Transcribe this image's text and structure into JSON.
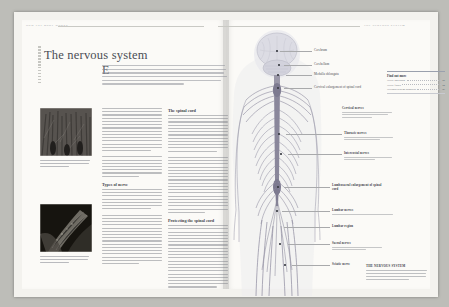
{
  "document": {
    "kind": "book-spread-scan",
    "title": "The nervous system",
    "left_running_head": "HOW THE BODY WORKS",
    "right_running_head": "THE NERVOUS SYSTEM",
    "intro": "Every single second, whether you are awake or asleep, nerves carry information in the form of electrical impulses from every part of the body to the brain and back. Via this intricate network of nerves – the body's communication network – the brain monitors and controls all your bodily functions."
  },
  "body": {
    "column_a": {
      "para1_lines": 14,
      "subhead2": "Types of nerve",
      "para2_lines": 16
    },
    "column_b": {
      "subhead1": "The spinal cord",
      "para1_lines": 21,
      "subhead2": "Protecting the spinal cord",
      "para2_lines": 15
    }
  },
  "photos": [
    {
      "name": "nerve-cells-micrograph",
      "caption_lines": 3
    },
    {
      "name": "nerve-fibre-micrograph",
      "caption_lines": 3
    }
  ],
  "figure": {
    "labels": [
      {
        "text": "Cerebrum",
        "x": 82,
        "y": 20,
        "leader_from": 50,
        "dot_x": 44,
        "dot_y": 21
      },
      {
        "text": "Cerebellum",
        "x": 82,
        "y": 32,
        "leader_from": 50,
        "dot_x": 46,
        "dot_y": 35
      },
      {
        "text": "Medulla oblongata",
        "x": 82,
        "y": 43,
        "leader_from": 56,
        "dot_x": 47,
        "dot_y": 45
      },
      {
        "text": "Cervical enlargement of spinal cord",
        "x": 82,
        "y": 58,
        "leader_from": 52,
        "dot_x": 47,
        "dot_y": 58
      },
      {
        "text": "Cervical nerves",
        "x": 112,
        "y": 80,
        "leader_from": 0,
        "sub_lines": 3
      },
      {
        "text": "Thoracic nerves",
        "x": 112,
        "y": 104,
        "leader_from": 62,
        "dot_x": 49,
        "dot_y": 104,
        "sub_lines": 2
      },
      {
        "text": "Intercostal nerves",
        "x": 112,
        "y": 126,
        "leader_from": 62,
        "dot_x": 52,
        "dot_y": 122,
        "sub_lines": 2
      },
      {
        "text": "Lumbosacral enlargement of spinal cord",
        "x": 100,
        "y": 157,
        "leader_from": 56,
        "dot_x": 47,
        "dot_y": 156,
        "two_line": true
      },
      {
        "text": "Lumbar nerves",
        "x": 100,
        "y": 181,
        "leader_from": 50,
        "dot_x": 45,
        "dot_y": 180,
        "sub_lines": 1
      },
      {
        "text": "Lumbar region",
        "x": 100,
        "y": 198,
        "leader_from": 50,
        "dot_x": 46,
        "dot_y": 196
      },
      {
        "text": "Sacral nerves",
        "x": 100,
        "y": 215,
        "leader_from": 54,
        "dot_x": 48,
        "dot_y": 212,
        "sub_lines": 2
      },
      {
        "text": "Sciatic nerve",
        "x": 100,
        "y": 236,
        "leader_from": 58,
        "dot_x": 52,
        "dot_y": 234
      }
    ],
    "find_out_more": {
      "heading": "Find out more",
      "rows": [
        {
          "title": "Nerve and brain",
          "page": "42"
        },
        {
          "title": "Nerve fibres",
          "page": "44"
        },
        {
          "title": "Nervous system disorders",
          "page": "46"
        }
      ]
    },
    "caption": {
      "heading": "THE NERVOUS SYSTEM",
      "lines": 4
    }
  },
  "colors": {
    "paper": "#fbfaf7",
    "scan_background": "#bdbdb8",
    "text": "#3f434b",
    "rule": "#c9c9c4",
    "nerve": "#8d8b9c",
    "brain": "#dcdce4"
  }
}
